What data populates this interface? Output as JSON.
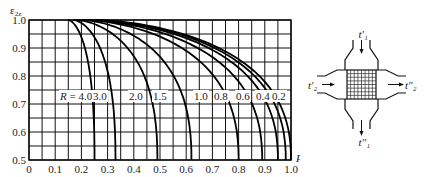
{
  "chart_data": {
    "type": "line",
    "title": "",
    "xlabel": "P",
    "ylabel": "ε_2z",
    "xlim": [
      0,
      1.0
    ],
    "ylim": [
      0.5,
      1.0
    ],
    "grid": true,
    "x_ticks": [
      "0",
      "0.1",
      "0.2",
      "0.3",
      "0.4",
      "0.5",
      "0.6",
      "0.7",
      "0.8",
      "0.9",
      "1.0"
    ],
    "y_ticks": [
      "0.5",
      "0.6",
      "0.7",
      "0.8",
      "0.9",
      "1.0"
    ],
    "parameter_label": "R",
    "series": [
      {
        "name": "R = 4.0",
        "label": "R = 4.0",
        "p_at_eps_0_5": 0.25,
        "p_at_eps_1_0": 0.15
      },
      {
        "name": "R = 3.0",
        "label": "3.0",
        "p_at_eps_0_5": 0.33,
        "p_at_eps_1_0": 0.17
      },
      {
        "name": "R = 2.0",
        "label": "2.0",
        "p_at_eps_0_5": 0.49,
        "p_at_eps_1_0": 0.18
      },
      {
        "name": "R = 1.5",
        "label": "1.5",
        "p_at_eps_0_5": 0.62,
        "p_at_eps_1_0": 0.2
      },
      {
        "name": "R = 1.0",
        "label": "1.0",
        "p_at_eps_0_5": 0.8,
        "p_at_eps_1_0": 0.21
      },
      {
        "name": "R = 0.8",
        "label": "0.8",
        "p_at_eps_0_5": 0.89,
        "p_at_eps_1_0": 0.22
      },
      {
        "name": "R = 0.6",
        "label": "0.6",
        "p_at_eps_0_5": 0.95,
        "p_at_eps_1_0": 0.23
      },
      {
        "name": "R = 0.4",
        "label": "0.4",
        "p_at_eps_0_5": 0.98,
        "p_at_eps_1_0": 0.24
      },
      {
        "name": "R = 0.2",
        "label": "0.2",
        "p_at_eps_0_5": 1.0,
        "p_at_eps_1_0": 0.25
      }
    ]
  },
  "axes": {
    "y_title": "ε",
    "y_title_sub": "2z",
    "x_title": "P"
  },
  "diagram": {
    "labels": {
      "t1_in": "t′₁",
      "t1_out": "t″₁",
      "t2_in": "t′₂",
      "t2_out": "t″₂"
    }
  }
}
